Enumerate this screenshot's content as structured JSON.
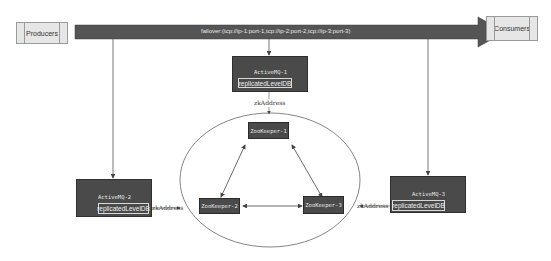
{
  "diagram": {
    "producers": {
      "label": "Producers"
    },
    "consumers": {
      "label": "Consumers"
    },
    "failover_arrow": {
      "label": "failover:(tcp://ip-1:port-1,tcp://ip-2:port-2,tcp://ip-3:port-3)"
    },
    "brokers": [
      {
        "name": "ActiveMQ-1",
        "store": "replicatedLevelDB"
      },
      {
        "name": "ActiveMQ-2",
        "store": "replicatedLevelDB"
      },
      {
        "name": "ActiveMQ-3",
        "store": "replicatedLevelDB"
      }
    ],
    "zookeepers": [
      {
        "name": "ZooKeeper-1"
      },
      {
        "name": "ZooKeeper-2"
      },
      {
        "name": "ZooKeeper-3"
      }
    ],
    "connector_label": "zkAddress",
    "colors": {
      "dark_box": "#4a4a4a",
      "light_box": "#e6e6e6",
      "arrow": "#555555",
      "line": "#555555"
    }
  }
}
